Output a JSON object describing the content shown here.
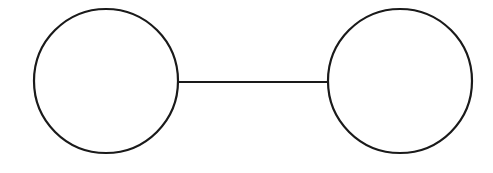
{
  "diagram": {
    "type": "graph",
    "background": "#ffffff",
    "stroke_color": "#1a1a1a",
    "nodes": [
      {
        "id": "left",
        "cx": 106,
        "cy": 81,
        "r": 72,
        "label": ""
      },
      {
        "id": "right",
        "cx": 400,
        "cy": 81,
        "r": 72,
        "label": ""
      }
    ],
    "edges": [
      {
        "from": "left",
        "to": "right",
        "x1": 178,
        "y1": 82,
        "x2": 328,
        "y2": 82
      }
    ]
  }
}
